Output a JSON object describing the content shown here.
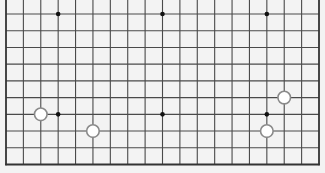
{
  "board": {
    "size": 19,
    "visible_columns": 19,
    "visible_rows": 10,
    "cropped_top": true,
    "background_color": "#f3f3f3",
    "line_color": "#4a4a4a",
    "border_color": "#333333",
    "star_color": "#111111",
    "geometry": {
      "left": 6,
      "right": 319,
      "top_line_y": 14,
      "bottom": 164.5
    },
    "star_points": [
      {
        "col": 3,
        "row": 0
      },
      {
        "col": 9,
        "row": 0
      },
      {
        "col": 15,
        "row": 0
      },
      {
        "col": 3,
        "row": 6
      },
      {
        "col": 9,
        "row": 6
      },
      {
        "col": 15,
        "row": 6
      }
    ],
    "stones": [
      {
        "color": "white",
        "col": 2,
        "row": 6
      },
      {
        "color": "white",
        "col": 5,
        "row": 7
      },
      {
        "color": "white",
        "col": 16,
        "row": 5
      },
      {
        "color": "white",
        "col": 15,
        "row": 7
      }
    ],
    "stone_style": {
      "white_fill": "#ffffff",
      "white_stroke": "#8a8a8a",
      "radius": 6.3
    }
  }
}
